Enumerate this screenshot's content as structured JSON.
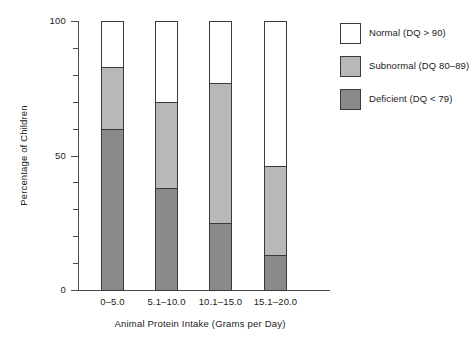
{
  "chart_data": {
    "type": "bar",
    "subtype": "stacked-vertical-percentage",
    "title": "",
    "xlabel": "Animal Protein Intake (Grams per Day)",
    "ylabel": "Percentage of Children",
    "categories": [
      "0–5.0",
      "5.1–10.0",
      "10.1–15.0",
      "15.1–20.0"
    ],
    "ylim": [
      0,
      100
    ],
    "y_tick_labels": [
      "0",
      "50",
      "100"
    ],
    "y_major_ticks": [
      0,
      50,
      100
    ],
    "y_minor_ticks": [
      10,
      20,
      30,
      40,
      60,
      70,
      80,
      90
    ],
    "grid": false,
    "legend_position": "right",
    "series": [
      {
        "name": "Deficient (DQ < 79)",
        "key": "deficient",
        "color": "#8a8a8a",
        "values": [
          60,
          38,
          25,
          13
        ]
      },
      {
        "name": "Subnormal (DQ 80–89)",
        "key": "subnormal",
        "color": "#b8b8b8",
        "values": [
          23,
          32,
          52,
          33
        ]
      },
      {
        "name": "Normal (DQ > 90)",
        "key": "normal",
        "color": "#ffffff",
        "values": [
          17,
          30,
          23,
          54
        ]
      }
    ],
    "cumulative_tops": {
      "deficient": [
        60,
        38,
        25,
        13
      ],
      "subnormal": [
        83,
        70,
        77,
        46
      ],
      "normal": [
        100,
        100,
        100,
        100
      ]
    }
  },
  "legend": {
    "items": [
      {
        "label": "Normal (DQ > 90)",
        "color": "#ffffff"
      },
      {
        "label": "Subnormal (DQ 80–89)",
        "color": "#b8b8b8"
      },
      {
        "label": "Deficient (DQ < 79)",
        "color": "#8a8a8a"
      }
    ]
  },
  "axes": {
    "y_title": "Percentage of Children",
    "x_title": "Animal Protein Intake (Grams per Day)",
    "y_labels": {
      "zero": "0",
      "fifty": "50",
      "hundred": "100"
    },
    "x_labels": [
      "0–5.0",
      "5.1–10.0",
      "10.1–15.0",
      "15.1–20.0"
    ]
  },
  "colors": {
    "deficient": "#8a8a8a",
    "subnormal": "#b8b8b8",
    "normal": "#ffffff",
    "axis": "#4a4a4a",
    "outline": "#3a3a3a",
    "text": "#1a1a1a",
    "background": "#ffffff"
  }
}
